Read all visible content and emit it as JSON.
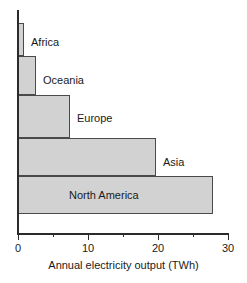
{
  "chart_data": {
    "type": "bar",
    "orientation": "horizontal",
    "title": "",
    "xlabel": "Annual electricity output (TWh)",
    "ylabel": "",
    "categories": [
      "Africa",
      "Oceania",
      "Europe",
      "Asia",
      "North America"
    ],
    "values": [
      0.8,
      2.6,
      7.4,
      19.7,
      27.9
    ],
    "xlim": [
      0,
      30
    ],
    "xticks": [
      0,
      5,
      10,
      15,
      20,
      25,
      30
    ],
    "xtick_labels": [
      "0",
      "",
      "10",
      "",
      "20",
      "",
      "30"
    ],
    "major_xticks": [
      0,
      10,
      20,
      30
    ],
    "minor_xticks": [
      5,
      15,
      25
    ],
    "grid": false,
    "legend": false,
    "bar_fill_color": "#d2d2d2",
    "bar_edge_color": "#4a4a4a",
    "axis_color": "#2b2b2b",
    "background_color": "#ffffff",
    "label_placement": [
      "outside",
      "outside",
      "outside",
      "outside",
      "inside"
    ]
  },
  "axis": {
    "x_title": "Annual electricity output (TWh)",
    "tick_0": "0",
    "tick_10": "10",
    "tick_20": "20",
    "tick_30": "30"
  },
  "bars": [
    {
      "label": "Africa",
      "value": 0.8
    },
    {
      "label": "Oceania",
      "value": 2.6
    },
    {
      "label": "Europe",
      "value": 7.4
    },
    {
      "label": "Asia",
      "value": 19.7
    },
    {
      "label": "North America",
      "value": 27.9
    }
  ]
}
